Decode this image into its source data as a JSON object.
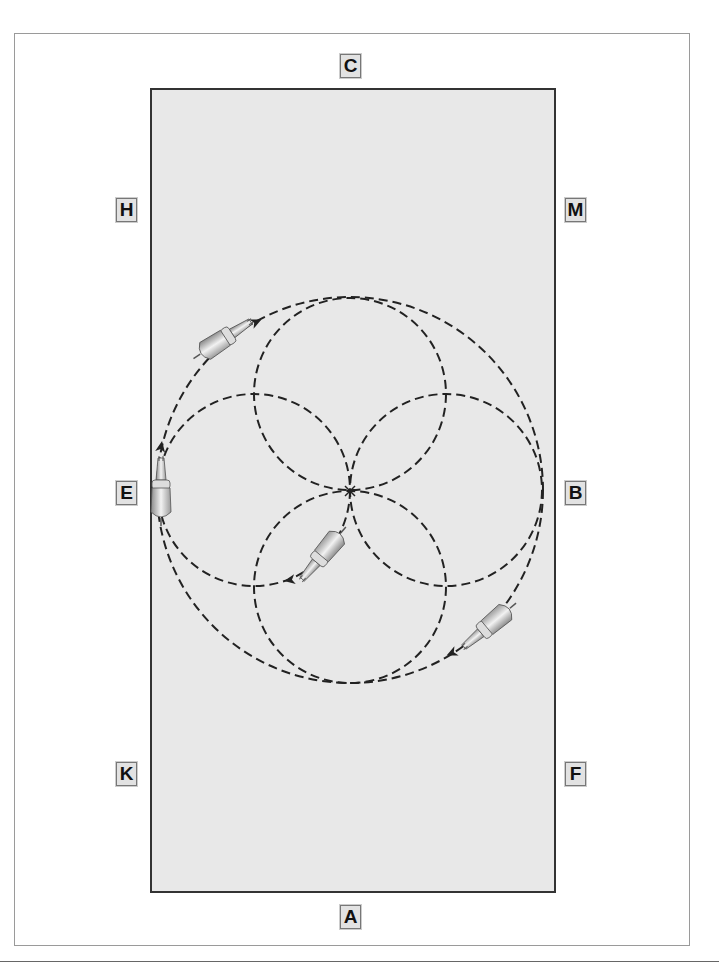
{
  "diagram": {
    "type": "dressage-arena-figure",
    "figure": "four circles within a large circle (clover pattern)",
    "arena": {
      "fill": "#e8e8e8",
      "border": "#333333"
    },
    "markers": [
      {
        "id": "C",
        "label": "C",
        "x": 340,
        "y": 54
      },
      {
        "id": "H",
        "label": "H",
        "x": 116,
        "y": 198
      },
      {
        "id": "M",
        "label": "M",
        "x": 565,
        "y": 198
      },
      {
        "id": "E",
        "label": "E",
        "x": 116,
        "y": 481
      },
      {
        "id": "B",
        "label": "B",
        "x": 565,
        "y": 481
      },
      {
        "id": "K",
        "label": "K",
        "x": 116,
        "y": 762
      },
      {
        "id": "F",
        "label": "F",
        "x": 565,
        "y": 762
      },
      {
        "id": "A",
        "label": "A",
        "x": 340,
        "y": 905
      }
    ],
    "paths": {
      "large_circle": {
        "cx": 350,
        "cy": 490,
        "r": 193
      },
      "small_circles": [
        {
          "name": "top",
          "cx": 350,
          "cy": 394,
          "r": 96
        },
        {
          "name": "bottom",
          "cx": 350,
          "cy": 587,
          "r": 96
        },
        {
          "name": "left",
          "cx": 254,
          "cy": 490,
          "r": 96
        },
        {
          "name": "right",
          "cx": 446,
          "cy": 490,
          "r": 96
        }
      ],
      "center_mark": "X",
      "line_style": "dashed"
    },
    "horses": [
      {
        "name": "horse-upper-left",
        "x": 222,
        "y": 340,
        "rotation": 57
      },
      {
        "name": "horse-at-E",
        "x": 161,
        "y": 487,
        "rotation": 0
      },
      {
        "name": "horse-center",
        "x": 322,
        "y": 555,
        "rotation": -140
      },
      {
        "name": "horse-lower-right",
        "x": 488,
        "y": 627,
        "rotation": -130
      }
    ],
    "direction_arrows": [
      {
        "x": 256,
        "y": 322,
        "rotation": 65
      },
      {
        "x": 161,
        "y": 447,
        "rotation": 10
      },
      {
        "x": 290,
        "y": 580,
        "rotation": -100
      },
      {
        "x": 452,
        "y": 653,
        "rotation": -115
      }
    ]
  }
}
